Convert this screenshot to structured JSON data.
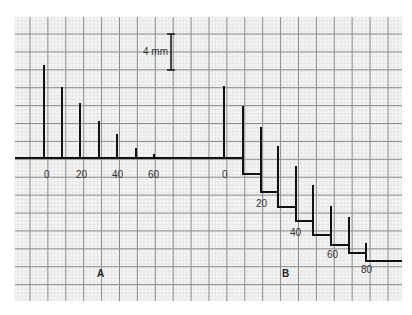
{
  "figure": {
    "scale_bar": {
      "label": "4 mm"
    },
    "panels": [
      {
        "id": "A",
        "label": "A",
        "tick_labels": [
          "0",
          "20",
          "40",
          "60"
        ]
      },
      {
        "id": "B",
        "label": "B",
        "tick_labels": [
          "0",
          "20",
          "40",
          "60",
          "80"
        ]
      }
    ]
  },
  "colors": {
    "paper": "#f4f4f4",
    "grid_major": "#8c8c8c",
    "grid_minor": "#d8d8d8",
    "trace": "#111111"
  },
  "traces": {
    "A": {
      "baseline_y": 158,
      "spikes": [
        {
          "x": 44,
          "top": 65
        },
        {
          "x": 62,
          "top": 87
        },
        {
          "x": 80,
          "top": 103
        },
        {
          "x": 99,
          "top": 121
        },
        {
          "x": 117,
          "top": 134
        },
        {
          "x": 136,
          "top": 148
        },
        {
          "x": 154,
          "top": 154
        },
        {
          "x": 172,
          "top": 157
        }
      ]
    },
    "B": {
      "start_y": 158,
      "steps": [
        {
          "x": 224,
          "top": 86,
          "after": 158
        },
        {
          "x": 243,
          "top": 106,
          "after": 174
        },
        {
          "x": 261,
          "top": 127,
          "after": 192
        },
        {
          "x": 278,
          "top": 146,
          "after": 207
        },
        {
          "x": 296,
          "top": 166,
          "after": 221
        },
        {
          "x": 313,
          "top": 185,
          "after": 235
        },
        {
          "x": 331,
          "top": 206,
          "after": 245
        },
        {
          "x": 349,
          "top": 217,
          "after": 253
        },
        {
          "x": 366,
          "top": 243,
          "after": 261
        }
      ],
      "end_x": 402
    }
  }
}
